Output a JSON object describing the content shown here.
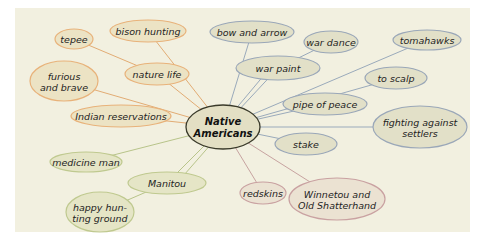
{
  "diagram": {
    "type": "mind-map",
    "background": "#f2f0e0",
    "panel": {
      "x": 15,
      "y": 8,
      "w": 455,
      "h": 224
    },
    "center": {
      "id": "native-americans",
      "lines": [
        "Native",
        "Americans"
      ],
      "cx": 223,
      "cy": 127,
      "rx": 37,
      "ry": 22,
      "fill": "#e3dfc4",
      "stroke": "#3a3a2a"
    },
    "colors": {
      "orange": {
        "fill": "#ece3c4",
        "stroke": "#e8b27a",
        "line": "#e2ac74"
      },
      "green": {
        "fill": "#e5e5c6",
        "stroke": "#bfc98f",
        "line": "#b8c48a"
      },
      "red": {
        "fill": "#ebe2d2",
        "stroke": "#c9a1a1",
        "line": "#c7a3a0"
      },
      "blue": {
        "fill": "#e2e0c8",
        "stroke": "#9aa7b8",
        "line": "#9aaabb"
      }
    },
    "nodes": [
      {
        "id": "tepee",
        "lines": [
          "tepee"
        ],
        "cx": 74,
        "cy": 39,
        "rx": 19,
        "ry": 10,
        "color": "orange",
        "parent": "nature-life"
      },
      {
        "id": "bison-hunting",
        "lines": [
          "bison hunting"
        ],
        "cx": 148,
        "cy": 31,
        "rx": 38,
        "ry": 11,
        "color": "orange",
        "parent": "native-americans"
      },
      {
        "id": "furious-and-brave",
        "lines": [
          "furious",
          "and brave"
        ],
        "cx": 64,
        "cy": 81,
        "rx": 34,
        "ry": 20,
        "color": "orange",
        "parent": "native-americans"
      },
      {
        "id": "nature-life",
        "lines": [
          "nature life"
        ],
        "cx": 157,
        "cy": 74,
        "rx": 32,
        "ry": 11,
        "color": "orange",
        "parent": "native-americans"
      },
      {
        "id": "indian-reservations",
        "lines": [
          "Indian reservations"
        ],
        "cx": 121,
        "cy": 116,
        "rx": 50,
        "ry": 11,
        "color": "orange",
        "parent": "native-americans"
      },
      {
        "id": "medicine-man",
        "lines": [
          "medicine man"
        ],
        "cx": 86,
        "cy": 162,
        "rx": 36,
        "ry": 10,
        "color": "green",
        "parent": "native-americans"
      },
      {
        "id": "manitou",
        "lines": [
          "Manitou"
        ],
        "cx": 167,
        "cy": 183,
        "rx": 39,
        "ry": 11,
        "color": "green",
        "parent": "native-americans"
      },
      {
        "id": "happy-hunting-ground",
        "lines": [
          "happy hun-",
          "ting ground"
        ],
        "cx": 100,
        "cy": 212,
        "rx": 34,
        "ry": 20,
        "color": "green",
        "parent": "manitou"
      },
      {
        "id": "redskins",
        "lines": [
          "redskins"
        ],
        "cx": 263,
        "cy": 193,
        "rx": 23,
        "ry": 11,
        "color": "red",
        "parent": "native-americans"
      },
      {
        "id": "winnetou",
        "lines": [
          "Winnetou and",
          "Old Shatterhand"
        ],
        "cx": 337,
        "cy": 199,
        "rx": 48,
        "ry": 21,
        "color": "red",
        "parent": "native-americans"
      },
      {
        "id": "stake",
        "lines": [
          "stake"
        ],
        "cx": 306,
        "cy": 144,
        "rx": 31,
        "ry": 11,
        "color": "blue",
        "parent": "native-americans"
      },
      {
        "id": "fighting-against-settlers",
        "lines": [
          "fighting against",
          "settlers"
        ],
        "cx": 420,
        "cy": 127,
        "rx": 47,
        "ry": 21,
        "color": "blue",
        "parent": "native-americans"
      },
      {
        "id": "pipe-of-peace",
        "lines": [
          "pipe of peace"
        ],
        "cx": 325,
        "cy": 104,
        "rx": 42,
        "ry": 11,
        "color": "blue",
        "parent": "native-americans"
      },
      {
        "id": "to-scalp",
        "lines": [
          "to scalp"
        ],
        "cx": 396,
        "cy": 78,
        "rx": 31,
        "ry": 11,
        "color": "blue",
        "parent": "native-americans"
      },
      {
        "id": "tomahawks",
        "lines": [
          "tomahawks"
        ],
        "cx": 427,
        "cy": 40,
        "rx": 34,
        "ry": 10,
        "color": "blue",
        "parent": "native-americans"
      },
      {
        "id": "war-dance",
        "lines": [
          "war dance"
        ],
        "cx": 331,
        "cy": 42,
        "rx": 27,
        "ry": 11,
        "color": "blue",
        "parent": "war-paint"
      },
      {
        "id": "war-paint",
        "lines": [
          "war paint"
        ],
        "cx": 278,
        "cy": 68,
        "rx": 42,
        "ry": 12,
        "color": "blue",
        "parent": "native-americans"
      },
      {
        "id": "bow-and-arrow",
        "lines": [
          "bow and arrow"
        ],
        "cx": 252,
        "cy": 32,
        "rx": 42,
        "ry": 11,
        "color": "blue",
        "parent": "native-americans"
      }
    ],
    "extra_edges": [
      {
        "from": "war-paint",
        "to": "native-americans",
        "color": "blue",
        "offset": -8
      },
      {
        "from": "manitou",
        "to": "native-americans",
        "color": "green",
        "offset": 10
      }
    ]
  }
}
